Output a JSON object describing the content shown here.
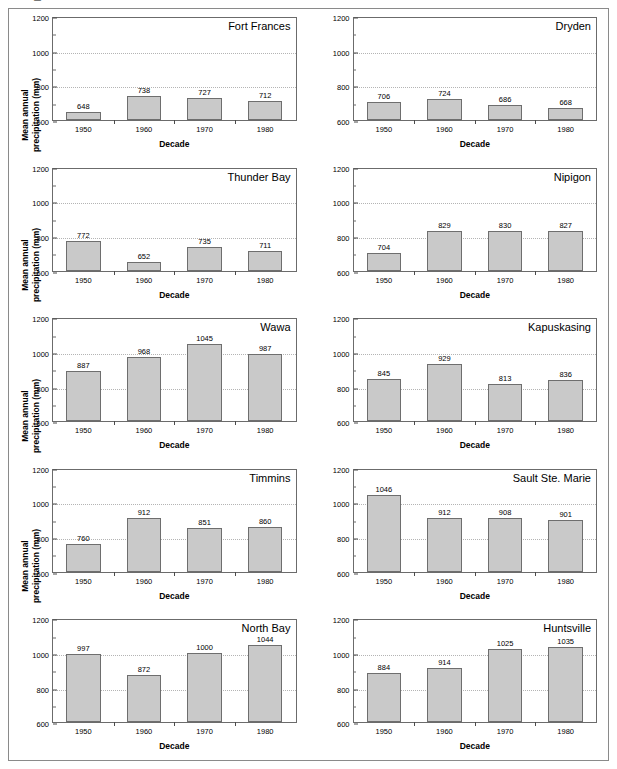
{
  "figure": {
    "axis_title_y": "Mean annual precipitation (mm)",
    "axis_title_x": "Decade",
    "bar_fill": "#c9c9c9",
    "bar_stroke": "#6e6e6e",
    "gridline_color": "#b4b4b4"
  },
  "axes": {
    "categories": [
      "1950",
      "1960",
      "1970",
      "1980"
    ],
    "ylim": [
      600,
      1200
    ],
    "yticks_major": [
      600,
      800,
      1000,
      1200
    ],
    "yticks_minor": [
      700,
      900,
      1100
    ],
    "gridlines": [
      800,
      1000
    ]
  },
  "chart_data": [
    {
      "type": "bar",
      "title": "Fort Frances",
      "xlabel": "Decade",
      "ylabel": "Mean annual precipitation (mm)",
      "categories": [
        "1950",
        "1960",
        "1970",
        "1980"
      ],
      "values": [
        648,
        738,
        727,
        712
      ],
      "ylim": [
        600,
        1200
      ],
      "grid": true,
      "legend": "none"
    },
    {
      "type": "bar",
      "title": "Dryden",
      "xlabel": "Decade",
      "ylabel": "",
      "categories": [
        "1950",
        "1960",
        "1970",
        "1980"
      ],
      "values": [
        706,
        724,
        686,
        668
      ],
      "ylim": [
        600,
        1200
      ],
      "grid": true,
      "legend": "none"
    },
    {
      "type": "bar",
      "title": "Thunder Bay",
      "xlabel": "Decade",
      "ylabel": "Mean annual precipitation (mm)",
      "categories": [
        "1950",
        "1960",
        "1970",
        "1980"
      ],
      "values": [
        772,
        652,
        735,
        711
      ],
      "ylim": [
        600,
        1200
      ],
      "grid": true,
      "legend": "none"
    },
    {
      "type": "bar",
      "title": "Nipigon",
      "xlabel": "Decade",
      "ylabel": "",
      "categories": [
        "1950",
        "1960",
        "1970",
        "1980"
      ],
      "values": [
        704,
        829,
        830,
        827
      ],
      "ylim": [
        600,
        1200
      ],
      "grid": true,
      "legend": "none"
    },
    {
      "type": "bar",
      "title": "Wawa",
      "xlabel": "Decade",
      "ylabel": "Mean annual precipitation (mm)",
      "categories": [
        "1950",
        "1960",
        "1970",
        "1980"
      ],
      "values": [
        887,
        968,
        1045,
        987
      ],
      "ylim": [
        600,
        1200
      ],
      "grid": true,
      "legend": "none"
    },
    {
      "type": "bar",
      "title": "Kapuskasing",
      "xlabel": "Decade",
      "ylabel": "",
      "categories": [
        "1950",
        "1960",
        "1970",
        "1980"
      ],
      "values": [
        845,
        929,
        813,
        836
      ],
      "ylim": [
        600,
        1200
      ],
      "grid": true,
      "legend": "none"
    },
    {
      "type": "bar",
      "title": "Timmins",
      "xlabel": "Decade",
      "ylabel": "Mean annual precipitation (mm)",
      "categories": [
        "1950",
        "1960",
        "1970",
        "1980"
      ],
      "values": [
        760,
        912,
        851,
        860
      ],
      "ylim": [
        600,
        1200
      ],
      "grid": true,
      "legend": "none"
    },
    {
      "type": "bar",
      "title": "Sault Ste. Marie",
      "xlabel": "Decade",
      "ylabel": "",
      "categories": [
        "1950",
        "1960",
        "1970",
        "1980"
      ],
      "values": [
        1046,
        912,
        908,
        901
      ],
      "ylim": [
        600,
        1200
      ],
      "grid": true,
      "legend": "none"
    },
    {
      "type": "bar",
      "title": "North Bay",
      "xlabel": "Decade",
      "ylabel": "Mean annual precipitation (mm)",
      "categories": [
        "1950",
        "1960",
        "1970",
        "1980"
      ],
      "values": [
        997,
        872,
        1000,
        1044
      ],
      "ylim": [
        600,
        1200
      ],
      "grid": true,
      "legend": "none"
    },
    {
      "type": "bar",
      "title": "Huntsville",
      "xlabel": "Decade",
      "ylabel": "",
      "categories": [
        "1950",
        "1960",
        "1970",
        "1980"
      ],
      "values": [
        884,
        914,
        1025,
        1035
      ],
      "ylim": [
        600,
        1200
      ],
      "grid": true,
      "legend": "none"
    }
  ]
}
